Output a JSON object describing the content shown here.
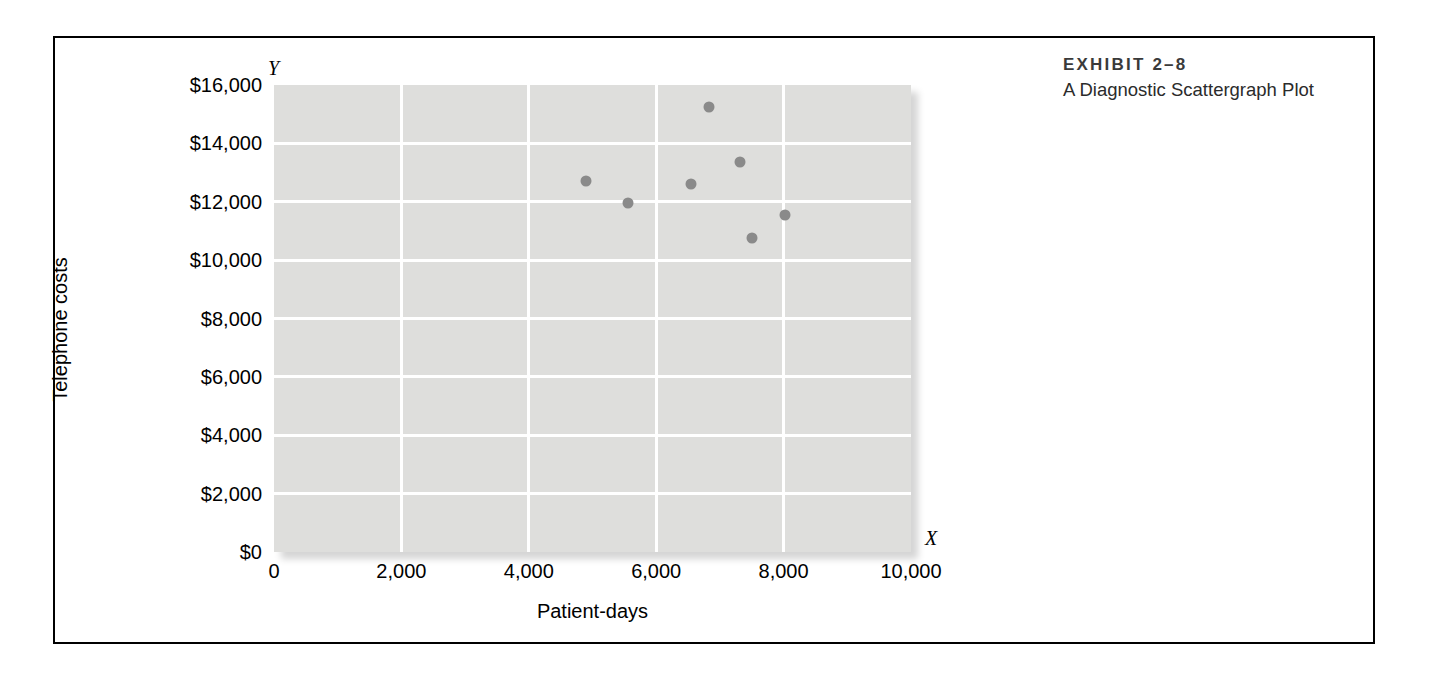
{
  "exhibit": {
    "number": "EXHIBIT 2–8",
    "title": "A Diagnostic Scattergraph Plot"
  },
  "axis_markers": {
    "y": "Y",
    "x": "X"
  },
  "colors": {
    "plot_background": "#dededc",
    "gridline": "#ffffff",
    "point": "#8a8a8a",
    "border": "#000000",
    "caption_text": "#3a3a3a"
  },
  "chart_data": {
    "type": "scatter",
    "title": "A Diagnostic Scattergraph Plot",
    "xlabel": "Patient-days",
    "ylabel": "Telephone costs",
    "xlim": [
      0,
      10000
    ],
    "ylim": [
      0,
      16000
    ],
    "grid": true,
    "legend": "none",
    "xticks": [
      0,
      2000,
      4000,
      6000,
      8000,
      10000
    ],
    "xticklabels": [
      "0",
      "2,000",
      "4,000",
      "6,000",
      "8,000",
      "10,000"
    ],
    "yticks": [
      0,
      2000,
      4000,
      6000,
      8000,
      10000,
      12000,
      14000,
      16000
    ],
    "yticklabels": [
      "$0",
      "$2,000",
      "$4,000",
      "$6,000",
      "$8,000",
      "$10,000",
      "$12,000",
      "$14,000",
      "$16,000"
    ],
    "points": [
      {
        "x": 4900,
        "y": 12700
      },
      {
        "x": 5550,
        "y": 11950
      },
      {
        "x": 6550,
        "y": 12600
      },
      {
        "x": 6830,
        "y": 15250
      },
      {
        "x": 7320,
        "y": 13350
      },
      {
        "x": 7500,
        "y": 10750
      },
      {
        "x": 8020,
        "y": 11550
      }
    ]
  }
}
